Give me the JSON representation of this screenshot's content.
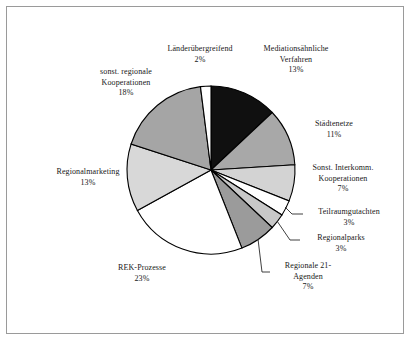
{
  "figure": {
    "border_color": "#9a9a9a",
    "background": "#ffffff"
  },
  "chart_data": {
    "type": "pie",
    "title": "",
    "subtitle": "",
    "xlabel": "",
    "ylabel": "",
    "legend_position": "labels-around-pie",
    "grid": false,
    "label_format": "name + percent",
    "total_percent": 100,
    "categories": [
      "Mediationsähnliche Verfahren",
      "Städtenetze",
      "Sonst. Interkomm. Kooperationen",
      "Teilraumgutachten",
      "Regionalparks",
      "Regionale 21-Agenden",
      "REK-Prozesse",
      "Regionalmarketing",
      "sonst. regionale Kooperationen",
      "Länderübergreifend"
    ],
    "values": [
      13,
      11,
      7,
      3,
      3,
      7,
      23,
      13,
      18,
      2
    ],
    "colors": [
      "#101010",
      "#a8a8a8",
      "#d3d3d3",
      "#ffffff",
      "#c8c8c8",
      "#9b9b9b",
      "#ffffff",
      "#d8d8d8",
      "#a5a5a5",
      "#ffffff"
    ],
    "slices": [
      {
        "name": "Mediationsähnliche Verfahren",
        "value": 13,
        "percent_label": "13%",
        "color": "#101010"
      },
      {
        "name": "Städtenetze",
        "value": 11,
        "percent_label": "11%",
        "color": "#a8a8a8"
      },
      {
        "name": "Sonst. Interkomm. Kooperationen",
        "value": 7,
        "percent_label": "7%",
        "color": "#d3d3d3"
      },
      {
        "name": "Teilraumgutachten",
        "value": 3,
        "percent_label": "3%",
        "color": "#ffffff"
      },
      {
        "name": "Regionalparks",
        "value": 3,
        "percent_label": "3%",
        "color": "#c8c8c8"
      },
      {
        "name": "Regionale 21-Agenden",
        "value": 7,
        "percent_label": "7%",
        "color": "#9b9b9b"
      },
      {
        "name": "REK-Prozesse",
        "value": 23,
        "percent_label": "23%",
        "color": "#ffffff"
      },
      {
        "name": "Regionalmarketing",
        "value": 13,
        "percent_label": "13%",
        "color": "#d8d8d8"
      },
      {
        "name": "sonst. regionale Kooperationen",
        "value": 18,
        "percent_label": "18%",
        "color": "#a5a5a5"
      },
      {
        "name": "Länderübergreifend",
        "value": 2,
        "percent_label": "2%",
        "color": "#ffffff"
      }
    ]
  },
  "labels": {
    "laenderuebergreifend": {
      "line1": "Länderübergreifend",
      "value": "2%"
    },
    "mediation": {
      "line1": "Mediationsähnliche",
      "line2": "Verfahren",
      "value": "13%"
    },
    "staedtenetze": {
      "line1": "Städtenetze",
      "value": "11%"
    },
    "interkomm": {
      "line1": "Sonst. Interkomm.",
      "line2": "Kooperationen",
      "value": "7%"
    },
    "teilraum": {
      "line1": "Teilraumgutachten",
      "value": "3%"
    },
    "regionalparks": {
      "line1": "Regionalparks",
      "value": "3%"
    },
    "agenda21": {
      "line1": "Regionale 21-",
      "line2": "Agenden",
      "value": "7%"
    },
    "rek": {
      "line1": "REK-Prozesse",
      "value": "23%"
    },
    "regionalmarketing": {
      "line1": "Regionalmarketing",
      "value": "13%"
    },
    "sonst_regionale": {
      "line1": "sonst. regionale",
      "line2": "Kooperationen",
      "value": "18%"
    }
  }
}
